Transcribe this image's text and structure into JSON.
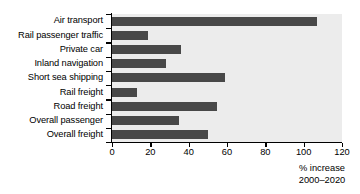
{
  "chart_data": {
    "type": "bar",
    "orientation": "horizontal",
    "title": "",
    "subtitle": "",
    "xlabel": "% increase 2000–2020",
    "ylabel": "",
    "categories": [
      "Air transport",
      "Rail passenger traffic",
      "Private car",
      "Inland navigation",
      "Short sea shipping",
      "Rail freight",
      "Road freight",
      "Overall passenger",
      "Overall freight"
    ],
    "values": [
      107,
      19,
      36,
      28,
      59,
      13,
      55,
      35,
      50
    ],
    "xlim": [
      0,
      120
    ],
    "xticks": [
      0,
      20,
      40,
      60,
      80,
      100,
      120
    ],
    "xtick_labels": [
      "0",
      "20",
      "40",
      "60",
      "80",
      "100",
      "120"
    ],
    "grid": false,
    "legend": null,
    "bar_color": "#484848",
    "plot_background": "#ececec",
    "axis_color": "#000000"
  },
  "caption": {
    "line1": "% increase",
    "line2": "2000–2020"
  }
}
